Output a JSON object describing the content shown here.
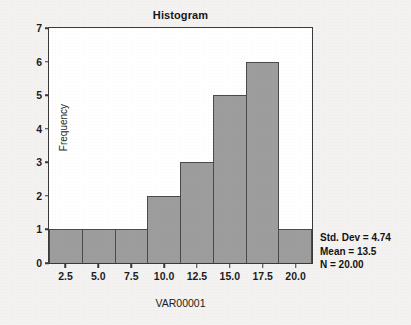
{
  "chart_data": {
    "type": "bar",
    "title": "Histogram",
    "xlabel": "VAR00001",
    "ylabel": "Frequency",
    "categories": [
      "2.5",
      "5.0",
      "7.5",
      "10.0",
      "12.5",
      "15.0",
      "17.5",
      "20.0"
    ],
    "values": [
      1,
      1,
      1,
      2,
      3,
      5,
      6,
      1
    ],
    "xtick_labels": [
      "2.5",
      "5.0",
      "7.5",
      "10.0",
      "12.5",
      "15.0",
      "17.5",
      "20.0"
    ],
    "ytick_labels": [
      "0",
      "1",
      "2",
      "3",
      "4",
      "5",
      "6",
      "7"
    ],
    "ylim": [
      0,
      7
    ],
    "grid": false,
    "legend": false,
    "bar_fill_color": "#9d9d9d",
    "bar_edge_color": "#4a4a4a",
    "plot_background_color": "#ffffff",
    "figure_background_color": "#f3f2f0",
    "annotations": [
      "Std. Dev = 4.74",
      "Mean = 13.5",
      "N = 20.00"
    ]
  },
  "stats": {
    "std_dev_line": "Std. Dev = 4.74",
    "mean_line": "Mean = 13.5",
    "n_line": "N = 20.00"
  }
}
